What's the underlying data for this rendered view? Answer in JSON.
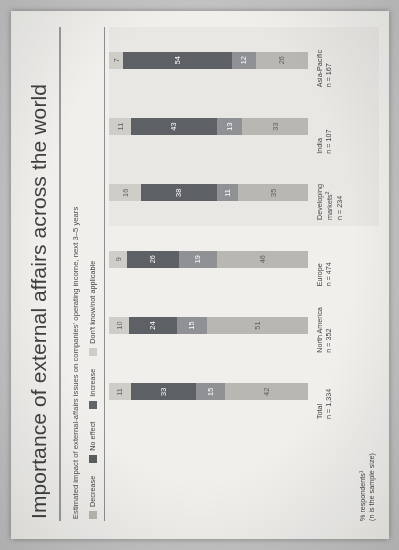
{
  "title": "Importance of external affairs across the world",
  "subtitle": "Estimated impact of external-affairs issues on companies' operating income, next 3–5 years",
  "axis_header": {
    "line1": "% respondents¹",
    "line2": "(n is the sample size)"
  },
  "legend": {
    "items": [
      {
        "label": "Decrease",
        "color": "#b8b7b2",
        "name": "decrease"
      },
      {
        "label": "No effect",
        "color": "#585b5e",
        "name": "no-effect"
      },
      {
        "label": "Increase",
        "color": "#5f6367",
        "name": "increase"
      },
      {
        "label": "Don't know/not applicable",
        "color": "#cfcec9",
        "name": "dont-know"
      }
    ]
  },
  "colors": {
    "decrease": "#b8b7b2",
    "no_effect": "#8e9093",
    "increase": "#5b5f63",
    "dont_know": "#cfcec9",
    "highlight_band": "#eae9e5",
    "paper": "#f2f1ee",
    "rule": "#9a9a9a",
    "text": "#3f3f3f"
  },
  "chart_data": {
    "type": "bar",
    "orientation": "vertical-stacked-100",
    "title": "Importance of external affairs across the world",
    "subtitle": "Estimated impact of external-affairs issues on companies' operating income, next 3–5 years",
    "xlabel": "",
    "ylabel": "% respondents¹",
    "ylim": [
      0,
      100
    ],
    "grid": false,
    "legend_position": "top-left",
    "categories": [
      "Total",
      "North America",
      "Europe",
      "Developing markets²",
      "India",
      "Asia-Pacific"
    ],
    "sample_sizes": [
      "n = 1,334",
      "n = 352",
      "n = 474",
      "n = 234",
      "n = 107",
      "n = 167"
    ],
    "series": [
      {
        "name": "Decrease",
        "values": [
          42,
          51,
          46,
          35,
          33,
          26
        ]
      },
      {
        "name": "No effect",
        "values": [
          15,
          15,
          19,
          11,
          13,
          12
        ]
      },
      {
        "name": "Increase",
        "values": [
          33,
          24,
          26,
          38,
          43,
          54
        ]
      },
      {
        "name": "Don't know/not applicable",
        "values": [
          11,
          10,
          9,
          16,
          11,
          7
        ]
      }
    ]
  },
  "rows": [
    {
      "name": "Total",
      "n": "n = 1,334",
      "highlight": false,
      "segments": [
        {
          "key": "decrease",
          "value": 42
        },
        {
          "key": "no_effect",
          "value": 15
        },
        {
          "key": "increase",
          "value": 33
        },
        {
          "key": "dont_know",
          "value": 11
        }
      ]
    },
    {
      "name": "North America",
      "n": "n = 352",
      "highlight": false,
      "segments": [
        {
          "key": "decrease",
          "value": 51
        },
        {
          "key": "no_effect",
          "value": 15
        },
        {
          "key": "increase",
          "value": 24
        },
        {
          "key": "dont_know",
          "value": 10
        }
      ]
    },
    {
      "name": "Europe",
      "n": "n = 474",
      "highlight": false,
      "segments": [
        {
          "key": "decrease",
          "value": 46
        },
        {
          "key": "no_effect",
          "value": 19
        },
        {
          "key": "increase",
          "value": 26
        },
        {
          "key": "dont_know",
          "value": 9
        }
      ]
    },
    {
      "name": "Developing markets",
      "sup": "2",
      "n": "n = 234",
      "highlight": true,
      "segments": [
        {
          "key": "decrease",
          "value": 35
        },
        {
          "key": "no_effect",
          "value": 11
        },
        {
          "key": "increase",
          "value": 38
        },
        {
          "key": "dont_know",
          "value": 16
        }
      ]
    },
    {
      "name": "India",
      "n": "n = 107",
      "highlight": true,
      "segments": [
        {
          "key": "decrease",
          "value": 33
        },
        {
          "key": "no_effect",
          "value": 13
        },
        {
          "key": "increase",
          "value": 43
        },
        {
          "key": "dont_know",
          "value": 11
        }
      ]
    },
    {
      "name": "Asia-Pacific",
      "n": "n = 167",
      "highlight": true,
      "segments": [
        {
          "key": "decrease",
          "value": 26
        },
        {
          "key": "no_effect",
          "value": 12
        },
        {
          "key": "increase",
          "value": 54
        },
        {
          "key": "dont_know",
          "value": 7
        }
      ]
    }
  ]
}
